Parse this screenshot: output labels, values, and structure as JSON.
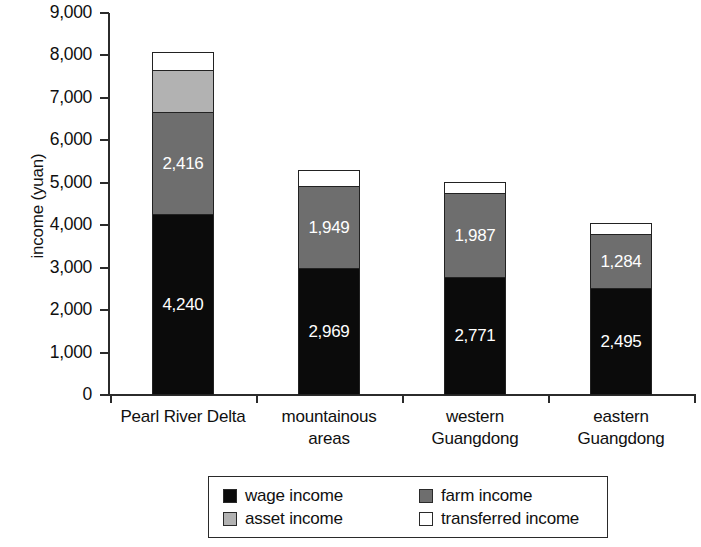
{
  "chart_data": {
    "type": "bar",
    "subtype": "stacked-bar",
    "title": "",
    "xlabel": "",
    "ylabel": "income (yuan)",
    "ylim": [
      0,
      9000
    ],
    "ytick_step": 1000,
    "ytick_labels": [
      "0",
      "1,000",
      "2,000",
      "3,000",
      "4,000",
      "5,000",
      "6,000",
      "7,000",
      "8,000",
      "9,000"
    ],
    "grid": false,
    "legend_position": "bottom",
    "categories": [
      "Pearl River Delta",
      "mountainous areas",
      "western Guangdong",
      "eastern Guangdong"
    ],
    "category_lines": [
      [
        "Pearl River Delta"
      ],
      [
        "mountainous",
        "areas"
      ],
      [
        "western",
        "Guangdong"
      ],
      [
        "eastern",
        "Guangdong"
      ]
    ],
    "series": [
      {
        "name": "wage income",
        "color": "#0b0b0b",
        "values": [
          4240,
          2969,
          2771,
          2495
        ],
        "labels": [
          "4,240",
          "2,969",
          "2,771",
          "2,495"
        ]
      },
      {
        "name": "farm income",
        "color": "#6e6e6e",
        "values": [
          2416,
          1949,
          1987,
          1284
        ],
        "labels": [
          "2,416",
          "1,949",
          "1,987",
          "1,284"
        ]
      },
      {
        "name": "asset income",
        "color": "#b2b2b2",
        "values": [
          1010,
          0,
          0,
          0
        ],
        "labels": [
          "",
          "",
          "",
          ""
        ]
      },
      {
        "name": "transferred income",
        "color": "#ffffff",
        "values": [
          414,
          372,
          272,
          281
        ],
        "labels": [
          "",
          "",
          "",
          ""
        ]
      }
    ],
    "totals": [
      8080,
      5290,
      5030,
      4060
    ]
  },
  "legend": {
    "entries": [
      {
        "label": "wage income",
        "key": "wage"
      },
      {
        "label": "farm income",
        "key": "farm"
      },
      {
        "label": "asset income",
        "key": "asset"
      },
      {
        "label": "transferred income",
        "key": "transferred"
      }
    ]
  }
}
